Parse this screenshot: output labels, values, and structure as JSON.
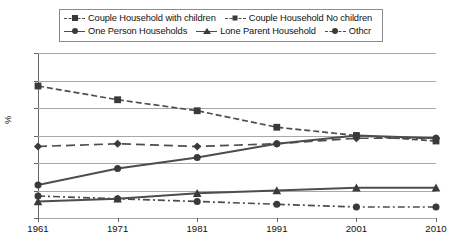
{
  "legend": {
    "rows": [
      [
        {
          "label": "Couple Household with children",
          "marker": "square",
          "line": "dashed"
        },
        {
          "label": "Couple Household No children",
          "marker": "diamond",
          "line": "longdash"
        }
      ],
      [
        {
          "label": "One Person Households",
          "marker": "circle",
          "line": "solid"
        },
        {
          "label": "Lone Parent Household",
          "marker": "triangle",
          "line": "solid"
        },
        {
          "label": "Othcr",
          "marker": "circle",
          "line": "dashdot"
        }
      ]
    ]
  },
  "axes": {
    "ylabel": "%",
    "yticks": [
      "60",
      "50",
      "40",
      "30",
      "20",
      "10",
      "0"
    ],
    "xticks": [
      "1961",
      "1971",
      "1981",
      "1991",
      "2001",
      "2010"
    ]
  },
  "colors": {
    "line": "#4d4d4d",
    "marker": "#3a3a3a",
    "grid": "#a8a8a8",
    "axis": "#666666",
    "text": "#111111"
  },
  "chart_data": {
    "type": "line",
    "title": "",
    "xlabel": "",
    "ylabel": "%",
    "ylim": [
      0,
      60
    ],
    "ytick_step": 10,
    "grid": true,
    "legend_position": "top",
    "categories": [
      "1961",
      "1971",
      "1981",
      "1991",
      "2001",
      "2010"
    ],
    "x": [
      1961,
      1971,
      1981,
      1991,
      2001,
      2010
    ],
    "series": [
      {
        "name": "Couple Household with children",
        "marker": "square",
        "linestyle": "dashed",
        "values": [
          48,
          43,
          39,
          33,
          30,
          28
        ]
      },
      {
        "name": "Couple Household No children",
        "marker": "diamond",
        "linestyle": "longdash",
        "values": [
          26,
          27,
          26,
          27,
          29,
          29
        ]
      },
      {
        "name": "One Person Households",
        "marker": "circle",
        "linestyle": "solid",
        "values": [
          12,
          18,
          22,
          27,
          30,
          29
        ]
      },
      {
        "name": "Lone Parent Household",
        "marker": "triangle",
        "linestyle": "solid",
        "values": [
          6,
          7,
          9,
          10,
          11,
          11
        ]
      },
      {
        "name": "Othcr",
        "marker": "circle",
        "linestyle": "dashdot",
        "values": [
          8,
          7,
          6,
          5,
          4,
          4
        ]
      }
    ]
  }
}
